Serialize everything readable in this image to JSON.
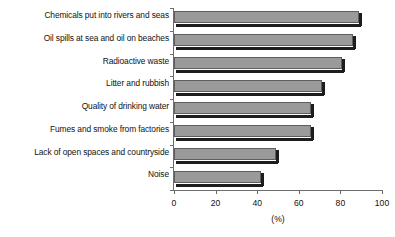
{
  "chart_data": {
    "type": "bar",
    "orientation": "horizontal",
    "title": "",
    "subtitle": "",
    "xlabel": "(%)",
    "ylabel": "",
    "xlim": [
      0,
      100
    ],
    "xticks": [
      0,
      20,
      40,
      60,
      80,
      100
    ],
    "grid": false,
    "legend": null,
    "categories": [
      "Chemicals put into rivers and seas",
      "Oil spills at sea and oil on beaches",
      "Radioactive waste",
      "Litter and rubbish",
      "Quality of drinking water",
      "Fumes and smoke from factories",
      "Lack of open spaces and countryside",
      "Noise"
    ],
    "values": [
      89,
      86,
      81,
      71,
      66,
      66,
      49,
      42
    ],
    "series": [
      {
        "name": "Percentage",
        "values": [
          89,
          86,
          81,
          71,
          66,
          66,
          49,
          42
        ]
      }
    ],
    "colors": {
      "bar_fill": "#9a9a9a",
      "bar_edge": "#5e5e5e",
      "bar_shadow": "#1d1d1d",
      "axis": "#6d6d6d",
      "text": "#111111",
      "background": "#ffffff"
    }
  }
}
